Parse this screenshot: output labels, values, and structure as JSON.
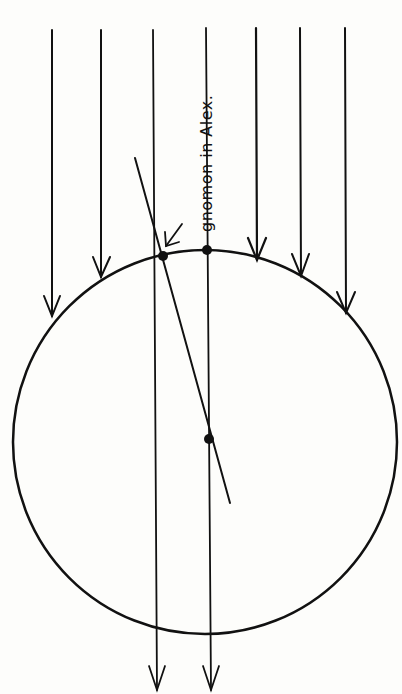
{
  "diagram": {
    "title": "",
    "label": "gnomon in Alex.",
    "stroke_color": "#111111",
    "background": "#fdfdfb",
    "sun_rays": [
      {
        "x": 52,
        "y1": 30,
        "y2": 318
      },
      {
        "x": 101,
        "y1": 30,
        "y2": 278
      },
      {
        "x": 153,
        "y1": 30,
        "y2": 694,
        "passes_through": true
      },
      {
        "x": 206,
        "y1": 28,
        "y2": 694,
        "passes_through": true
      },
      {
        "x": 256,
        "y1": 28,
        "y2": 260
      },
      {
        "x": 300,
        "y1": 28,
        "y2": 276
      },
      {
        "x": 345,
        "y1": 28,
        "y2": 314
      }
    ],
    "earth": {
      "cx": 205,
      "cy": 442,
      "r": 192
    },
    "points": [
      {
        "name": "alexandria",
        "x": 163,
        "y": 256
      },
      {
        "name": "syene",
        "x": 207,
        "y": 250
      },
      {
        "name": "earth-center",
        "x": 209,
        "y": 439
      }
    ],
    "gnomon_line": {
      "x1": 135,
      "y1": 158,
      "x2": 230,
      "y2": 503
    }
  }
}
